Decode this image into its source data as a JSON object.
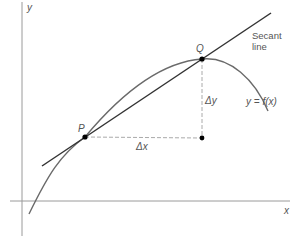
{
  "diagram": {
    "axes": {
      "x_label": "x",
      "y_label": "y"
    },
    "points": {
      "P": {
        "label": "P"
      },
      "Q": {
        "label": "Q"
      }
    },
    "labels": {
      "secant_line_1": "Secant",
      "secant_line_2": "line",
      "delta_x": "Δx",
      "delta_y": "Δy",
      "function": "y = f(x)"
    },
    "colors": {
      "curve": "#666666",
      "secant": "#333333",
      "axes": "#999999",
      "dashed": "#aaaaaa",
      "points": "#000000"
    }
  }
}
